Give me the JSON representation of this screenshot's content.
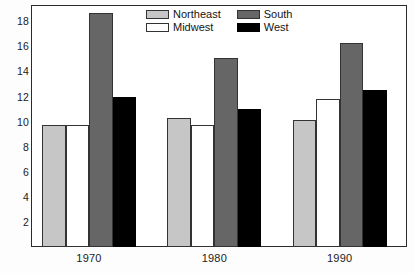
{
  "chart_data": {
    "type": "bar",
    "title": "",
    "subtitle": "",
    "xlabel": "",
    "ylabel": "",
    "categories": [
      "1970",
      "1980",
      "1990"
    ],
    "series": [
      {
        "name": "Northeast",
        "color": "#c6c6c6",
        "values": [
          9.7,
          10.3,
          10.1
        ]
      },
      {
        "name": "Midwest",
        "color": "#ffffff",
        "values": [
          9.7,
          9.7,
          11.8
        ]
      },
      {
        "name": "South",
        "color": "#666666",
        "values": [
          18.7,
          15.1,
          16.3
        ]
      },
      {
        "name": "West",
        "color": "#000000",
        "values": [
          12.0,
          11.0,
          12.5
        ]
      }
    ],
    "yticks": [
      2,
      4,
      6,
      8,
      10,
      12,
      14,
      16,
      18
    ],
    "ylim": [
      0,
      19.3
    ],
    "grid": false,
    "legend_position": "top-center",
    "legend_entries": [
      "Northeast",
      "South",
      "Midwest",
      "West"
    ],
    "frame": true
  },
  "axis": {
    "y_tick_labels": [
      "18",
      "16",
      "14",
      "12",
      "10",
      "8",
      "6",
      "4",
      "2"
    ],
    "x_tick_labels": [
      "1970",
      "1980",
      "1990"
    ]
  },
  "legend": {
    "items": [
      {
        "label": "Northeast",
        "key": "northeast"
      },
      {
        "label": "South",
        "key": "south"
      },
      {
        "label": "Midwest",
        "key": "midwest"
      },
      {
        "label": "West",
        "key": "west"
      }
    ]
  }
}
